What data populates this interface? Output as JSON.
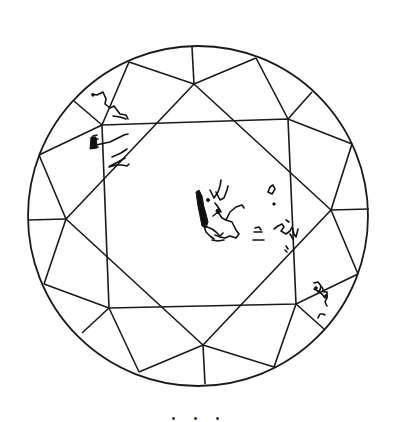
{
  "diagram": {
    "type": "gemstone-clarity-plot",
    "girdle": {
      "cx": 198,
      "cy": 216,
      "r": 170
    },
    "girdle_points": [
      [
        192,
        47
      ],
      [
        256,
        58
      ],
      [
        312,
        92
      ],
      [
        352,
        144
      ],
      [
        369,
        209
      ],
      [
        358,
        274
      ],
      [
        324,
        329
      ],
      [
        274,
        367
      ],
      [
        205,
        384
      ],
      [
        139,
        372
      ],
      [
        82,
        333
      ],
      [
        44,
        284
      ],
      [
        28,
        220
      ],
      [
        39,
        155
      ],
      [
        74,
        101
      ],
      [
        129,
        62
      ]
    ],
    "star_points": {
      "top": [
        194,
        84
      ],
      "right": [
        331,
        210
      ],
      "bottom": [
        203,
        345
      ],
      "left": [
        66,
        219
      ]
    },
    "table_corners": {
      "top_left": [
        102,
        125
      ],
      "top_right": [
        288,
        119
      ],
      "bottom_right": [
        296,
        304
      ],
      "bottom_left": [
        109,
        308
      ]
    },
    "inclusions": [
      {
        "label": "feather-upper-left",
        "location": "upper-left crown facets"
      },
      {
        "label": "cloud-center",
        "location": "table center"
      },
      {
        "label": "pinpoints-center-right",
        "location": "table right"
      },
      {
        "label": "feather-lower-right",
        "location": "lower-right girdle"
      }
    ],
    "stroke_color": "#1a1a1a",
    "background_color": "#ffffff"
  },
  "caption": "· · ·"
}
